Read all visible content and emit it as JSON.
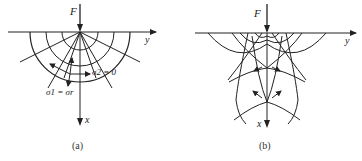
{
  "panel_a": {
    "force_label": "F",
    "x_axis_label": "x",
    "y_axis_label": "y",
    "annotation_sigma2": "σ2 = 0",
    "annotation_sigma1": "σ1 = σr",
    "caption": "(a)"
  },
  "panel_b": {
    "force_label": "F",
    "x_axis_label": "x",
    "y_axis_label": "y",
    "caption": "(b)"
  },
  "colors": {
    "line": "#222222",
    "background": "#ffffff"
  }
}
